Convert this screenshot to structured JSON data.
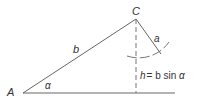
{
  "diagram": {
    "colors": {
      "line": "#666666",
      "text": "#333333",
      "background": "#ffffff"
    },
    "vertices": {
      "A": {
        "label": "A"
      },
      "C": {
        "label": "C"
      }
    },
    "sides": {
      "b": {
        "label": "b"
      },
      "a": {
        "label": "a"
      }
    },
    "angle": {
      "label": "α"
    },
    "altitude": {
      "label_h": "h",
      "label_eq": "= b sin ",
      "label_alpha": "α"
    }
  }
}
